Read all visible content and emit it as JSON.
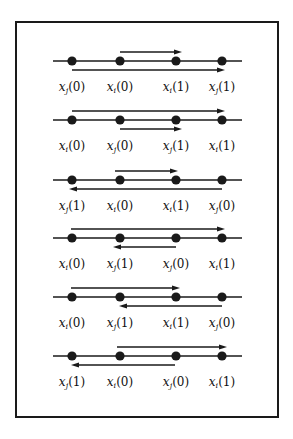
{
  "figure": {
    "colors": {
      "stroke": "#1a1a1a",
      "background": "#ffffff"
    },
    "x_positions": [
      72,
      120,
      176,
      222
    ],
    "rows": [
      {
        "labels": [
          [
            "x",
            "j",
            "0"
          ],
          [
            "x",
            "i",
            "0"
          ],
          [
            "x",
            "i",
            "1"
          ],
          [
            "x",
            "j",
            "1"
          ]
        ],
        "arrows": [
          {
            "position": "above",
            "from": 120,
            "to": 182,
            "direction": "right"
          },
          {
            "position": "below",
            "from": 72,
            "to": 225,
            "direction": "right"
          }
        ]
      },
      {
        "labels": [
          [
            "x",
            "i",
            "0"
          ],
          [
            "x",
            "j",
            "0"
          ],
          [
            "x",
            "j",
            "1"
          ],
          [
            "x",
            "i",
            "1"
          ]
        ],
        "arrows": [
          {
            "position": "above",
            "from": 72,
            "to": 225,
            "direction": "right"
          },
          {
            "position": "below",
            "from": 120,
            "to": 182,
            "direction": "right"
          }
        ]
      },
      {
        "labels": [
          [
            "x",
            "j",
            "1"
          ],
          [
            "x",
            "i",
            "0"
          ],
          [
            "x",
            "i",
            "1"
          ],
          [
            "x",
            "j",
            "0"
          ]
        ],
        "arrows": [
          {
            "position": "above",
            "from": 115,
            "to": 178,
            "direction": "right"
          },
          {
            "position": "below",
            "from": 222,
            "to": 69,
            "direction": "left"
          }
        ]
      },
      {
        "labels": [
          [
            "x",
            "i",
            "0"
          ],
          [
            "x",
            "j",
            "1"
          ],
          [
            "x",
            "j",
            "0"
          ],
          [
            "x",
            "i",
            "1"
          ]
        ],
        "arrows": [
          {
            "position": "above",
            "from": 71,
            "to": 225,
            "direction": "right"
          },
          {
            "position": "below",
            "from": 176,
            "to": 113,
            "direction": "left"
          }
        ]
      },
      {
        "labels": [
          [
            "x",
            "i",
            "0"
          ],
          [
            "x",
            "j",
            "1"
          ],
          [
            "x",
            "i",
            "1"
          ],
          [
            "x",
            "j",
            "0"
          ]
        ],
        "arrows": [
          {
            "position": "above",
            "from": 71,
            "to": 180,
            "direction": "right"
          },
          {
            "position": "below",
            "from": 222,
            "to": 119,
            "direction": "left"
          }
        ]
      },
      {
        "labels": [
          [
            "x",
            "j",
            "1"
          ],
          [
            "x",
            "i",
            "0"
          ],
          [
            "x",
            "j",
            "0"
          ],
          [
            "x",
            "i",
            "1"
          ]
        ],
        "arrows": [
          {
            "position": "above",
            "from": 117,
            "to": 227,
            "direction": "right"
          },
          {
            "position": "below",
            "from": 175,
            "to": 71,
            "direction": "left"
          }
        ]
      }
    ]
  }
}
